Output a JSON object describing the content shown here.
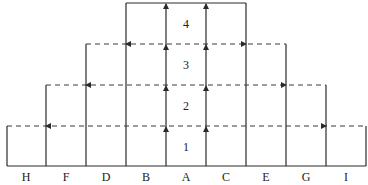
{
  "diagram": {
    "type": "stepped-layer-flow",
    "colors": {
      "line": "#2a2a2a",
      "dashed": "#3a3a3a",
      "background": "#ffffff"
    },
    "columns": [
      "H",
      "F",
      "D",
      "B",
      "A",
      "C",
      "E",
      "G",
      "I"
    ],
    "levels": [
      "1",
      "2",
      "3",
      "4"
    ],
    "arrows": {
      "vertical": "upward arrows along the two central lines (between B/A and A/C) at each level boundary",
      "horizontal": "dashed lines at each level boundary with arrows pointing outward to the next column line"
    }
  }
}
